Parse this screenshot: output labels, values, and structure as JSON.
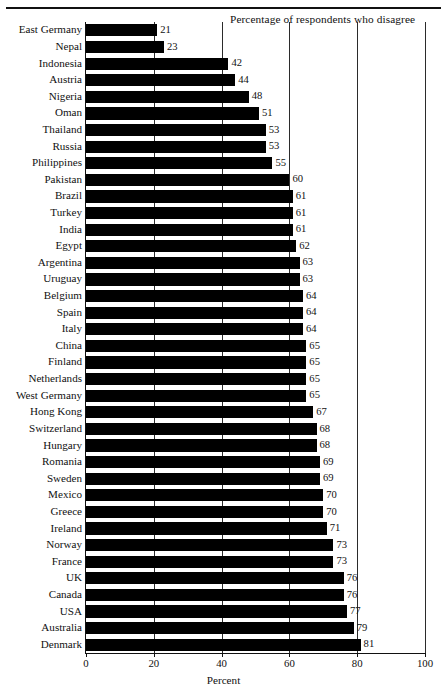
{
  "header": {
    "caption": "Percentage of respondents who disagree"
  },
  "chart_data": {
    "type": "bar",
    "orientation": "horizontal",
    "title": "",
    "subtitle": "",
    "annotations": [
      "Percentage of respondents who disagree"
    ],
    "xlabel": "Percent",
    "ylabel": "",
    "xlim": [
      0,
      100
    ],
    "xticks": [
      0,
      20,
      40,
      60,
      80,
      100
    ],
    "xtick_labels": [
      "0",
      "20",
      "40",
      "60",
      "80",
      "100"
    ],
    "grid": true,
    "grid_axis": "x",
    "legend": false,
    "bar_color": "#000000",
    "value_labels": true,
    "sort": "ascending",
    "categories": [
      "East Germany",
      "Nepal",
      "Indonesia",
      "Austria",
      "Nigeria",
      "Oman",
      "Thailand",
      "Russia",
      "Philippines",
      "Pakistan",
      "Brazil",
      "Turkey",
      "India",
      "Egypt",
      "Argentina",
      "Uruguay",
      "Belgium",
      "Spain",
      "Italy",
      "China",
      "Finland",
      "Netherlands",
      "West Germany",
      "Hong Kong",
      "Switzerland",
      "Hungary",
      "Romania",
      "Sweden",
      "Mexico",
      "Greece",
      "Ireland",
      "Norway",
      "France",
      "UK",
      "Canada",
      "USA",
      "Australia",
      "Denmark"
    ],
    "values": [
      21,
      23,
      42,
      44,
      48,
      51,
      53,
      53,
      55,
      60,
      61,
      61,
      61,
      62,
      63,
      63,
      64,
      64,
      64,
      65,
      65,
      65,
      65,
      67,
      68,
      68,
      69,
      69,
      70,
      70,
      71,
      73,
      73,
      76,
      76,
      77,
      79,
      81
    ]
  }
}
